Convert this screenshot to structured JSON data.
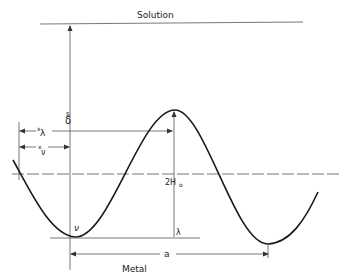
{
  "diagram": {
    "labels": {
      "solution": "Solution",
      "metal": "Metal",
      "delta": "δ",
      "delta_sub": "s",
      "x_lambda": "x",
      "x_lambda_sub": "λ",
      "x_nu": "x",
      "x_nu_sub": "ν",
      "two_h0": "2H",
      "two_h0_sub": "o",
      "nu": "ν",
      "lambda": "λ",
      "a": "a"
    },
    "colors": {
      "line": "#1a1a1a",
      "thin_line": "#555555",
      "background": "#ffffff"
    }
  }
}
